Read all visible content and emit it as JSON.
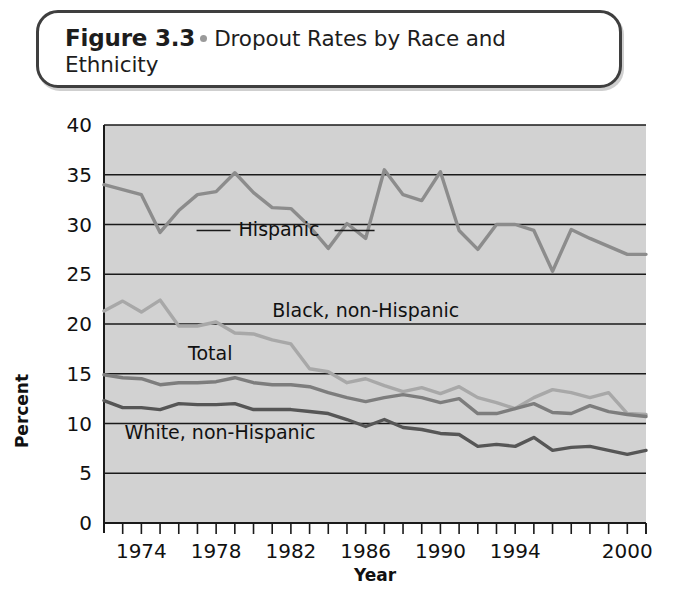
{
  "caption": {
    "label": "Figure 3.3",
    "separator_icon": "bullet-dot",
    "text": "Dropout Rates by Race and Ethnicity"
  },
  "chart_data": {
    "type": "line",
    "title": "Dropout Rates by Race and Ethnicity",
    "xlabel": "Year",
    "ylabel": "Percent",
    "xlim": [
      1972,
      2001
    ],
    "ylim": [
      0,
      40
    ],
    "ytick_labels": [
      "0",
      "5",
      "10",
      "15",
      "20",
      "25",
      "30",
      "35",
      "40"
    ],
    "yticks": [
      0,
      5,
      10,
      15,
      20,
      25,
      30,
      35,
      40
    ],
    "xtick_labels": [
      "1974",
      "1978",
      "1982",
      "1986",
      "1990",
      "1994",
      "2000"
    ],
    "xticks_labeled": [
      1974,
      1978,
      1982,
      1986,
      1990,
      1994,
      2000
    ],
    "x": [
      1972,
      1973,
      1974,
      1975,
      1976,
      1977,
      1978,
      1979,
      1980,
      1981,
      1982,
      1983,
      1984,
      1985,
      1986,
      1987,
      1988,
      1989,
      1990,
      1991,
      1992,
      1993,
      1994,
      1995,
      1996,
      1997,
      1998,
      1999,
      2000,
      2001
    ],
    "grid": "horizontal",
    "legend_position": "inline-labels",
    "plot_background": "#d2d2d2",
    "series": [
      {
        "name": "Hispanic",
        "color": "#8c8c8c",
        "label_x": 1979.2,
        "label_y": 29.4,
        "values": [
          34.0,
          33.5,
          33.0,
          29.2,
          31.4,
          33.0,
          33.3,
          35.2,
          33.2,
          31.7,
          31.6,
          29.8,
          27.6,
          30.1,
          28.6,
          35.5,
          33.0,
          32.4,
          35.3,
          29.4,
          27.5,
          30.0,
          30.0,
          29.4,
          25.3,
          29.5,
          28.6,
          27.8,
          27.0,
          27.0
        ]
      },
      {
        "name": "Black, non-Hispanic",
        "color": "#a8a8a8",
        "label_x": 1981.0,
        "label_y": 21.3,
        "values": [
          21.3,
          22.3,
          21.2,
          22.4,
          19.8,
          19.8,
          20.2,
          19.1,
          19.0,
          18.4,
          18.0,
          15.5,
          15.2,
          14.1,
          14.5,
          13.8,
          13.2,
          13.6,
          13.0,
          13.7,
          12.6,
          12.1,
          11.5,
          12.6,
          13.4,
          13.1,
          12.6,
          13.1,
          11.0,
          10.9
        ]
      },
      {
        "name": "Total",
        "color": "#7d7d7d",
        "label_x": 1976.5,
        "label_y": 17.0,
        "values": [
          14.9,
          14.6,
          14.5,
          13.9,
          14.1,
          14.1,
          14.2,
          14.6,
          14.1,
          13.9,
          13.9,
          13.7,
          13.1,
          12.6,
          12.2,
          12.6,
          12.9,
          12.6,
          12.1,
          12.5,
          11.0,
          11.0,
          11.5,
          12.0,
          11.1,
          11.0,
          11.8,
          11.2,
          10.9,
          10.7
        ]
      },
      {
        "name": "White, non-Hispanic",
        "color": "#565656",
        "label_x": 1973.1,
        "label_y": 9.0,
        "values": [
          12.3,
          11.6,
          11.6,
          11.4,
          12.0,
          11.9,
          11.9,
          12.0,
          11.4,
          11.4,
          11.4,
          11.2,
          11.0,
          10.4,
          9.7,
          10.4,
          9.6,
          9.4,
          9.0,
          8.9,
          7.7,
          7.9,
          7.7,
          8.6,
          7.3,
          7.6,
          7.7,
          7.3,
          6.9,
          7.3
        ]
      }
    ]
  }
}
